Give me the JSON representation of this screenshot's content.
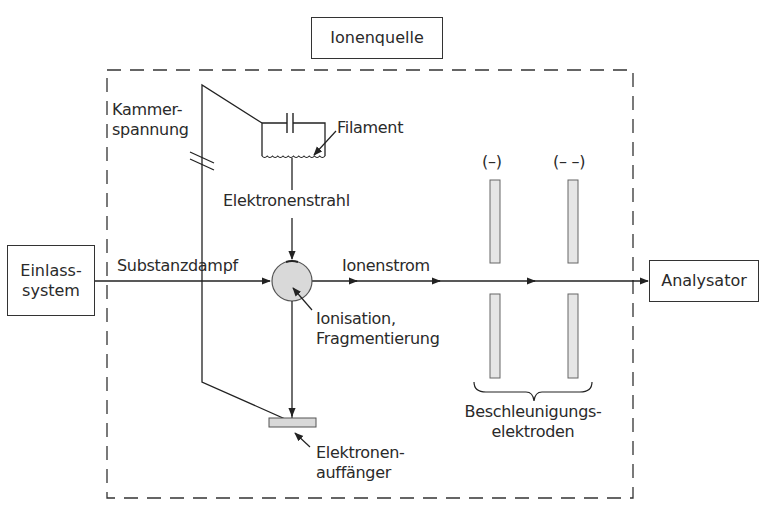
{
  "diagram": {
    "title_box": "Ionenquelle",
    "inlet_box": {
      "line1": "Einlass-",
      "line2": "system"
    },
    "analyzer_box": "Analysator",
    "labels": {
      "chamber_voltage": {
        "line1": "Kammer-",
        "line2": "spannung"
      },
      "filament": "Filament",
      "electron_beam": "Elektronenstrahl",
      "substance_vapor": "Substanzdampf",
      "ion_current": "Ionenstrom",
      "ionization": {
        "line1": "Ionisation,",
        "line2": "Fragmentierung"
      },
      "electron_collector": {
        "line1": "Elektronen-",
        "line2": "auffänger"
      },
      "electrode_1_charge": "(–)",
      "electrode_2_charge": "(– –)",
      "accel_electrodes": {
        "line1": "Beschleunigungs-",
        "line2": "elektroden"
      }
    },
    "colors": {
      "line": "#222222",
      "fill_gray": "#d9d9d9",
      "electrode_fill": "#e6e6e6"
    }
  }
}
